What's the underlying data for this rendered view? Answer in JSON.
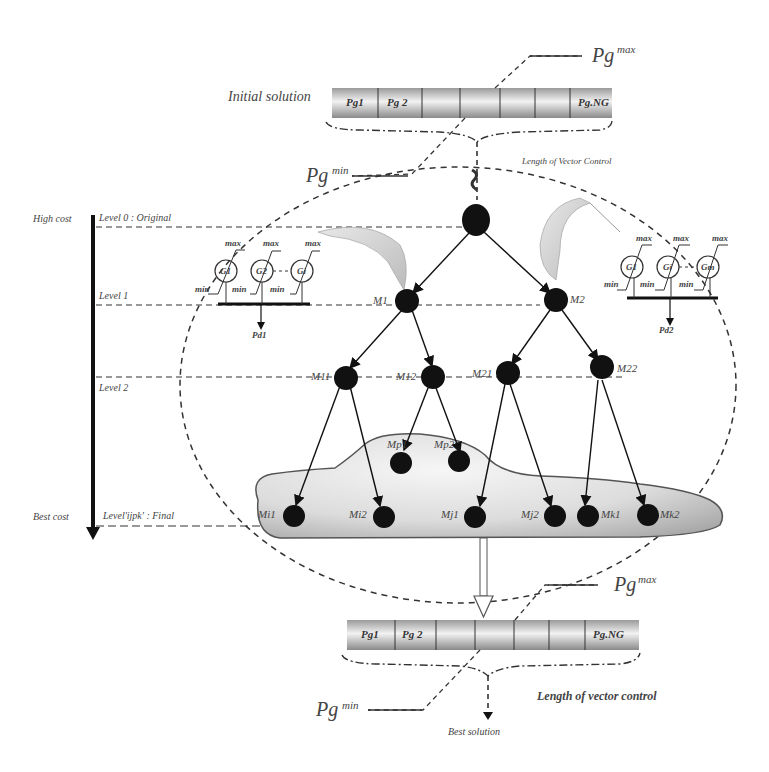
{
  "top_vector": {
    "label": "Initial solution",
    "cells": [
      "Pg1",
      "Pg 2",
      "",
      "",
      "",
      "",
      "Pg.NG"
    ],
    "pg_max": {
      "base": "Pg",
      "sup": "max"
    },
    "pg_min": {
      "base": "Pg",
      "sup": "min"
    },
    "caption": "Length of Vector Control"
  },
  "cost_axis": {
    "top": "High cost",
    "bottom": "Best cost"
  },
  "levels": [
    {
      "label": "Level 0 : Original"
    },
    {
      "label": "Level 1"
    },
    {
      "label": "Level 2"
    },
    {
      "label": "Level'ijpk' : Final"
    }
  ],
  "generator_groups": [
    {
      "gens": [
        "G1",
        "G2",
        "Gi"
      ],
      "max_label": "max",
      "min_label": "min",
      "load": "Pd1"
    },
    {
      "gens": [
        "G1",
        "Gi",
        "Gm"
      ],
      "max_label": "max",
      "min_label": "min",
      "load": "Pd2"
    }
  ],
  "tree_nodes": {
    "level1": [
      "M1",
      "M2"
    ],
    "level2": [
      "M11",
      "M12",
      "M21",
      "M22"
    ],
    "cloud_upper": [
      "Mp1",
      "Mp2"
    ],
    "final": [
      "Mi1",
      "Mi2",
      "Mj1",
      "Mj2",
      "Mk1",
      "Mk2"
    ]
  },
  "bottom_vector": {
    "cells": [
      "Pg1",
      "Pg 2",
      "",
      "",
      "",
      "",
      "Pg.NG"
    ],
    "pg_max": {
      "base": "Pg",
      "sup": "max"
    },
    "pg_min": {
      "base": "Pg",
      "sup": "min"
    },
    "caption": "Length of vector control",
    "result": "Best solution"
  },
  "colors": {
    "node": "#111111",
    "line": "#222222",
    "dash": "#333333",
    "cloud_fill": "#d8d8d8",
    "vector_fill": "#cfcfcf"
  }
}
